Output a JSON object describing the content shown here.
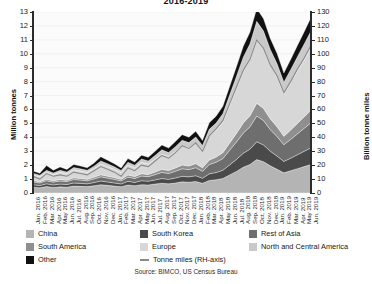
{
  "chart_data": {
    "type": "area",
    "title": "2016-2019",
    "xlabel": "",
    "ylabel": "Million tonnes",
    "y2label": "Billion tonne miles",
    "ylim": [
      0,
      13
    ],
    "y2lim": [
      0,
      130
    ],
    "yticks": [
      0,
      1,
      2,
      3,
      4,
      5,
      6,
      7,
      8,
      9,
      10,
      11,
      12,
      13
    ],
    "y2ticks": [
      0,
      10,
      20,
      30,
      40,
      50,
      60,
      70,
      80,
      90,
      100,
      110,
      120,
      130
    ],
    "grid": true,
    "legend_position": "bottom",
    "source": "Source: BIMCO, US Census Bureau",
    "categories": [
      "Jan. 2016",
      "Feb. 2016",
      "Mar. 2016",
      "Apr. 2016",
      "May 2016",
      "Jun. 2016",
      "Jul. 2016",
      "Aug. 2016",
      "Sep. 2016",
      "Oct. 2016",
      "Nov. 2016",
      "Dec. 2016",
      "Jan. 2017",
      "Feb. 2017",
      "Mar. 2017",
      "Apr. 2017",
      "May 2017",
      "Jun. 2017",
      "Jul. 2017",
      "Aug. 2017",
      "Sep. 2017",
      "Oct. 2017",
      "Nov. 2017",
      "Dec. 2017",
      "Jan. 2018",
      "Feb. 2018",
      "Mar. 2018",
      "Apr. 2018",
      "May 2018",
      "Jun. 2018",
      "Jul. 2018",
      "Aug. 2018",
      "Sep. 2018",
      "Oct. 2018",
      "Nov. 2018",
      "Dec. 2018",
      "Jan. 2019",
      "Feb. 2019",
      "Mar. 2019",
      "Apr. 2019",
      "May 2019",
      "Jun. 2019"
    ],
    "series": [
      {
        "name": "China",
        "color": "#b4b4b4",
        "values": [
          0.42,
          0.38,
          0.46,
          0.4,
          0.44,
          0.42,
          0.5,
          0.48,
          0.46,
          0.52,
          0.6,
          0.55,
          0.5,
          0.45,
          0.58,
          0.52,
          0.6,
          0.58,
          0.64,
          0.7,
          0.66,
          0.72,
          0.8,
          0.78,
          0.82,
          0.7,
          0.9,
          0.95,
          1.05,
          1.3,
          1.55,
          1.85,
          2.05,
          2.4,
          2.25,
          1.95,
          1.7,
          1.45,
          1.6,
          1.75,
          1.9,
          2.05
        ]
      },
      {
        "name": "South Korea",
        "color": "#4a4a4a",
        "values": [
          0.18,
          0.16,
          0.2,
          0.18,
          0.2,
          0.19,
          0.22,
          0.21,
          0.2,
          0.23,
          0.26,
          0.24,
          0.22,
          0.2,
          0.26,
          0.24,
          0.28,
          0.27,
          0.3,
          0.34,
          0.32,
          0.36,
          0.4,
          0.38,
          0.42,
          0.36,
          0.48,
          0.52,
          0.58,
          0.72,
          0.86,
          1.0,
          1.1,
          1.28,
          1.2,
          1.05,
          0.95,
          0.82,
          0.9,
          1.0,
          1.1,
          1.2
        ]
      },
      {
        "name": "Rest of Asia",
        "color": "#6e6e6e",
        "values": [
          0.2,
          0.18,
          0.22,
          0.2,
          0.22,
          0.21,
          0.25,
          0.24,
          0.22,
          0.26,
          0.3,
          0.28,
          0.26,
          0.22,
          0.3,
          0.28,
          0.34,
          0.32,
          0.38,
          0.44,
          0.42,
          0.48,
          0.54,
          0.52,
          0.58,
          0.5,
          0.66,
          0.74,
          0.84,
          1.05,
          1.25,
          1.45,
          1.6,
          1.85,
          1.75,
          1.55,
          1.4,
          1.2,
          1.35,
          1.5,
          1.65,
          1.8
        ]
      },
      {
        "name": "South America",
        "color": "#8f8f8f",
        "values": [
          0.1,
          0.09,
          0.11,
          0.1,
          0.11,
          0.1,
          0.12,
          0.12,
          0.11,
          0.13,
          0.15,
          0.14,
          0.13,
          0.11,
          0.15,
          0.14,
          0.17,
          0.16,
          0.19,
          0.22,
          0.21,
          0.24,
          0.27,
          0.26,
          0.29,
          0.25,
          0.33,
          0.37,
          0.42,
          0.52,
          0.62,
          0.72,
          0.8,
          0.92,
          0.87,
          0.77,
          0.7,
          0.6,
          0.67,
          0.75,
          0.82,
          0.9
        ]
      },
      {
        "name": "Europe",
        "color": "#d7d7d7",
        "values": [
          0.4,
          0.36,
          0.5,
          0.44,
          0.52,
          0.46,
          0.58,
          0.54,
          0.5,
          0.62,
          0.78,
          0.7,
          0.6,
          0.5,
          0.72,
          0.64,
          0.82,
          0.76,
          0.92,
          1.1,
          1.02,
          1.2,
          1.4,
          1.32,
          1.5,
          1.26,
          1.74,
          1.92,
          2.2,
          2.7,
          3.2,
          3.7,
          4.05,
          4.6,
          4.35,
          3.9,
          3.55,
          3.05,
          3.4,
          3.75,
          4.1,
          4.45
        ]
      },
      {
        "name": "North and Central America",
        "color": "#c9c9c9",
        "values": [
          0.12,
          0.11,
          0.14,
          0.12,
          0.14,
          0.13,
          0.16,
          0.15,
          0.14,
          0.17,
          0.21,
          0.19,
          0.17,
          0.14,
          0.2,
          0.18,
          0.23,
          0.21,
          0.26,
          0.3,
          0.28,
          0.33,
          0.38,
          0.36,
          0.41,
          0.34,
          0.47,
          0.52,
          0.6,
          0.74,
          0.88,
          1.02,
          1.12,
          1.28,
          1.21,
          1.08,
          0.98,
          0.84,
          0.94,
          1.04,
          1.14,
          1.24
        ]
      },
      {
        "name": "Other",
        "color": "#111111",
        "values": [
          0.16,
          0.14,
          0.34,
          0.2,
          0.24,
          0.18,
          0.22,
          0.2,
          0.18,
          0.22,
          0.3,
          0.26,
          0.22,
          0.18,
          0.26,
          0.22,
          0.28,
          0.26,
          0.3,
          0.34,
          0.32,
          0.36,
          0.4,
          0.38,
          0.42,
          0.36,
          0.46,
          0.5,
          0.54,
          0.62,
          0.7,
          0.78,
          0.84,
          0.92,
          0.88,
          0.8,
          0.74,
          0.66,
          0.72,
          0.8,
          0.88,
          0.96
        ]
      }
    ],
    "line_series": {
      "name": "Tonne miles (RH-axis)",
      "color": "#8a8a8a",
      "axis": "right",
      "values": [
        12,
        10,
        14,
        12,
        13,
        12,
        15,
        14,
        13,
        16,
        19,
        17,
        15,
        12,
        18,
        16,
        20,
        19,
        23,
        27,
        25,
        29,
        34,
        32,
        36,
        30,
        41,
        46,
        52,
        64,
        76,
        88,
        96,
        110,
        104,
        92,
        84,
        72,
        80,
        89,
        97,
        106
      ]
    }
  },
  "legend": {
    "items": [
      {
        "label": "China",
        "swatch": "#b4b4b4",
        "type": "box"
      },
      {
        "label": "South Korea",
        "swatch": "#4a4a4a",
        "type": "box"
      },
      {
        "label": "Rest of Asia",
        "swatch": "#6e6e6e",
        "type": "box"
      },
      {
        "label": "South America",
        "swatch": "#8f8f8f",
        "type": "box"
      },
      {
        "label": "Europe",
        "swatch": "#d7d7d7",
        "type": "box"
      },
      {
        "label": "North and Central America",
        "swatch": "#c9c9c9",
        "type": "box"
      },
      {
        "label": "Other",
        "swatch": "#111111",
        "type": "box"
      },
      {
        "label": "Tonne miles (RH-axis)",
        "swatch": "#8a8a8a",
        "type": "line"
      }
    ]
  }
}
